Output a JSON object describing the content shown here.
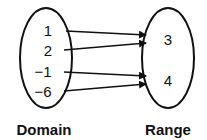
{
  "diagram": {
    "type": "mapping",
    "domain": {
      "label": "Domain",
      "values": [
        "1",
        "2",
        "−1",
        "−6"
      ]
    },
    "range": {
      "label": "Range",
      "values": [
        "3",
        "4"
      ]
    },
    "mappings": [
      {
        "from": "1",
        "to": "3"
      },
      {
        "from": "2",
        "to": "3"
      },
      {
        "from": "−1",
        "to": "4"
      },
      {
        "from": "−6",
        "to": "4"
      }
    ],
    "colors": {
      "stroke": "#111111",
      "background": "#ffffff"
    }
  }
}
